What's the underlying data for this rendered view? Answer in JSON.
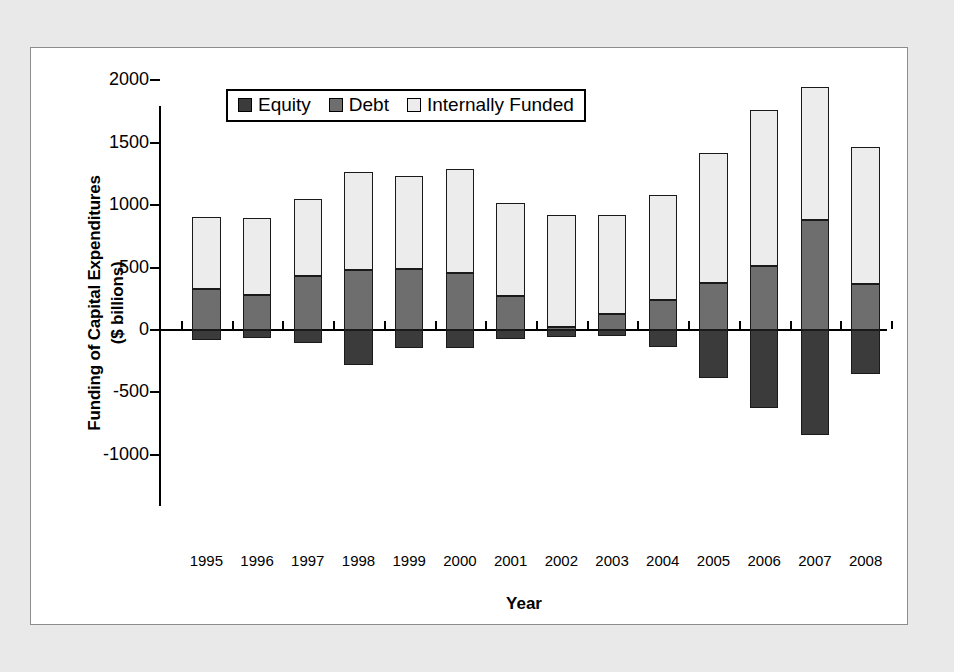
{
  "figure": {
    "background_color": "#e9e9e9",
    "frame_color": "#8c8c8c",
    "plot_background": "#ffffff"
  },
  "chart_data": {
    "type": "bar",
    "subtype": "stacked-bar-with-negative-values",
    "title": "",
    "xlabel": "Year",
    "ylabel": "Funding of Capital Expenditures ($ billions)",
    "ylabel_line1": "Funding of Capital Expenditures",
    "ylabel_line2": "($ billions)",
    "categories": [
      "1995",
      "1996",
      "1997",
      "1998",
      "1999",
      "2000",
      "2001",
      "2002",
      "2003",
      "2004",
      "2005",
      "2006",
      "2007",
      "2008"
    ],
    "ylim": [
      -1250,
      2100
    ],
    "yticks": [
      2000,
      1500,
      1000,
      500,
      0,
      -500,
      -1000
    ],
    "ytick_labels": [
      "2000",
      "1500",
      "1000",
      "500",
      "0",
      "-500",
      "-1000"
    ],
    "grid": false,
    "legend_position": "upper-left-inside",
    "series": [
      {
        "name": "Equity",
        "color": "#3b3b3b",
        "values": [
          -80,
          -60,
          -105,
          -280,
          -145,
          -145,
          -70,
          -55,
          -45,
          -140,
          -385,
          -625,
          -845,
          -355
        ]
      },
      {
        "name": "Debt",
        "color": "#6e6e6e",
        "values": [
          325,
          280,
          430,
          480,
          490,
          460,
          275,
          25,
          125,
          240,
          380,
          510,
          885,
          370
        ]
      },
      {
        "name": "Internally Funded",
        "color": "#ececec",
        "values": [
          580,
          620,
          620,
          790,
          745,
          830,
          745,
          900,
          800,
          840,
          1035,
          1250,
          1065,
          1095
        ]
      }
    ],
    "stack_tops": [
      905,
      900,
      1050,
      1270,
      1235,
      1290,
      1020,
      925,
      925,
      1080,
      1415,
      1760,
      1950,
      1465
    ]
  },
  "legend": {
    "items": [
      {
        "label": "Equity",
        "swatch": "#3b3b3b"
      },
      {
        "label": "Debt",
        "swatch": "#6e6e6e"
      },
      {
        "label": "Internally Funded",
        "swatch": "#ececec"
      }
    ]
  }
}
